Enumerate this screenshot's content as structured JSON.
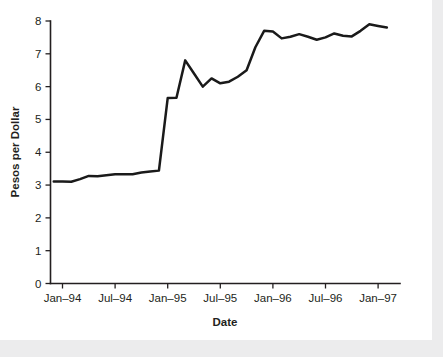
{
  "chart_data": {
    "type": "line",
    "title": "",
    "xlabel": "Date",
    "ylabel": "Pesos per Dollar",
    "ylim": [
      0,
      8
    ],
    "yticks": [
      0,
      1,
      2,
      3,
      4,
      5,
      6,
      7,
      8
    ],
    "ytick_labels": [
      "0",
      "1",
      "2",
      "3",
      "4",
      "5",
      "6",
      "7",
      "8"
    ],
    "xtick_labels": [
      "Jan–94",
      "Jul–94",
      "Jan–95",
      "Jul–95",
      "Jan–96",
      "Jul–96",
      "Jan–97"
    ],
    "xtick_values": [
      "1994-01",
      "1994-07",
      "1995-01",
      "1995-07",
      "1996-01",
      "1996-07",
      "1997-01"
    ],
    "grid": false,
    "legend": null,
    "line_color": "#1a1a1a",
    "series": [
      {
        "name": "Pesos per Dollar",
        "x": [
          "1993-12",
          "1994-01",
          "1994-02",
          "1994-03",
          "1994-04",
          "1994-05",
          "1994-06",
          "1994-07",
          "1994-08",
          "1994-09",
          "1994-10",
          "1994-11",
          "1994-12",
          "1995-01",
          "1995-02",
          "1995-03",
          "1995-04",
          "1995-05",
          "1995-06",
          "1995-07",
          "1995-08",
          "1995-09",
          "1995-10",
          "1995-11",
          "1995-12",
          "1996-01",
          "1996-02",
          "1996-03",
          "1996-04",
          "1996-05",
          "1996-06",
          "1996-07",
          "1996-08",
          "1996-09",
          "1996-10",
          "1996-11",
          "1996-12",
          "1997-01",
          "1997-02"
        ],
        "values": [
          3.11,
          3.11,
          3.1,
          3.18,
          3.28,
          3.27,
          3.3,
          3.33,
          3.33,
          3.33,
          3.38,
          3.41,
          3.44,
          5.65,
          5.66,
          6.8,
          6.4,
          6.0,
          6.25,
          6.1,
          6.15,
          6.3,
          6.5,
          7.2,
          7.7,
          7.68,
          7.47,
          7.52,
          7.6,
          7.52,
          7.43,
          7.5,
          7.62,
          7.55,
          7.53,
          7.7,
          7.9,
          7.85,
          7.8
        ]
      }
    ]
  },
  "axis_titles": {
    "x": "Date",
    "y": "Pesos per Dollar"
  }
}
